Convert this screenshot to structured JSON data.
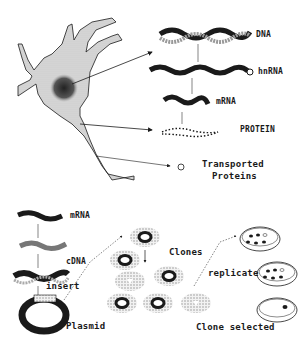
{
  "top_panel": {
    "labels": {
      "dna": "DNA",
      "hnrna": "hnRNA",
      "mrna": "mRNA",
      "protein": "PROTEIN",
      "transported_line1": "Transported",
      "transported_line2": "Proteins"
    }
  },
  "bottom_panel": {
    "labels": {
      "mrna": "mRNA",
      "cdna": "cDNA",
      "insert": "insert",
      "plasmid": "Plasmid",
      "clones": "Clones",
      "replicate": "replicate",
      "clone_selected": "Clone selected"
    }
  },
  "colors": {
    "ink": "#1a1a1a",
    "cell_fill": "#d4d4d4",
    "stipple": "#9a9a9a",
    "background": "#ffffff"
  }
}
